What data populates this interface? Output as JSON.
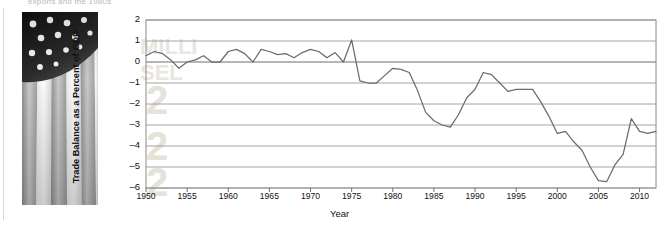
{
  "article": {
    "clipped_headline": "exports and the 1980s",
    "photo_credit": "AP Photo/Ben Margot",
    "photo_alt": "american-flag-photo"
  },
  "chart_data": {
    "type": "line",
    "title": "",
    "xlabel": "Year",
    "ylabel": "Trade Balance as a Percent of GDP",
    "xlim": [
      1950,
      2012
    ],
    "ylim": [
      -6,
      2
    ],
    "xticks": [
      "1950",
      "1955",
      "1960",
      "1965",
      "1970",
      "1975",
      "1980",
      "1985",
      "1990",
      "1995",
      "2000",
      "2005",
      "2010"
    ],
    "yticks": [
      "2",
      "1",
      "0",
      "-1",
      "-2",
      "-3",
      "-4",
      "-5",
      "-6"
    ],
    "grid": true,
    "legend": "none",
    "line_color": "#6b6b6b",
    "series": [
      {
        "name": "Trade Balance as a Percent of GDP",
        "x": [
          1950,
          1951,
          1952,
          1953,
          1954,
          1955,
          1956,
          1957,
          1958,
          1959,
          1960,
          1961,
          1962,
          1963,
          1964,
          1965,
          1966,
          1967,
          1968,
          1969,
          1970,
          1971,
          1972,
          1973,
          1974,
          1975,
          1976,
          1977,
          1978,
          1979,
          1980,
          1981,
          1982,
          1983,
          1984,
          1985,
          1986,
          1987,
          1988,
          1989,
          1990,
          1991,
          1992,
          1993,
          1994,
          1995,
          1996,
          1997,
          1998,
          1999,
          2000,
          2001,
          2002,
          2003,
          2004,
          2005,
          2006,
          2007,
          2008,
          2009,
          2010,
          2011,
          2012
        ],
        "values": [
          0.3,
          0.5,
          0.4,
          0.1,
          -0.3,
          0.0,
          0.1,
          0.3,
          0.0,
          0.0,
          0.5,
          0.6,
          0.4,
          0.0,
          0.6,
          0.5,
          0.35,
          0.4,
          0.2,
          0.45,
          0.6,
          0.5,
          0.2,
          0.45,
          0.0,
          1.05,
          -0.9,
          -1.0,
          -1.0,
          -0.65,
          -0.3,
          -0.35,
          -0.5,
          -1.35,
          -2.4,
          -2.8,
          -3.0,
          -3.1,
          -2.5,
          -1.7,
          -1.3,
          -0.5,
          -0.6,
          -1.0,
          -1.4,
          -1.3,
          -1.3,
          -1.3,
          -1.9,
          -2.6,
          -3.4,
          -3.3,
          -3.8,
          -4.2,
          -5.0,
          -5.65,
          -5.7,
          -4.9,
          -4.4,
          -2.7,
          -3.3,
          -3.4,
          -3.3
        ]
      }
    ]
  }
}
